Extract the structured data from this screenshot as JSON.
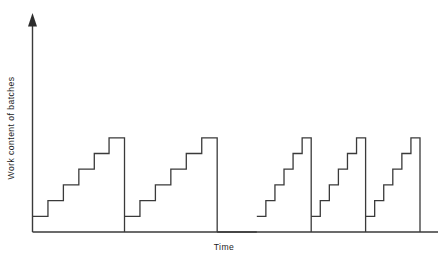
{
  "chart_data": {
    "type": "line",
    "title": "",
    "subtitle": "",
    "xlabel": "Time",
    "ylabel": "Work content of batches",
    "x_tick_labels": [],
    "y_tick_labels": [],
    "grid": false,
    "legend": null,
    "legend_position": "none",
    "xlim": [
      0,
      100
    ],
    "ylim": [
      0,
      7.6
    ],
    "axis_style": {
      "y_axis_arrow": true,
      "x_axis_arrow": false,
      "spines": [
        "left",
        "bottom"
      ],
      "line_color": "#3a3a3a"
    },
    "series": [
      {
        "name": "Work content of batches",
        "color": "#3a3a3a",
        "step_shape": "post",
        "cycles": [
          {
            "cycle_index": 1,
            "group": "wide",
            "x_start": 1.2,
            "x_end": 28.6,
            "peak_value": 6,
            "n_steps": 6,
            "points": [
              [
                1.2,
                1
              ],
              [
                5.8,
                1
              ],
              [
                5.8,
                2
              ],
              [
                10.4,
                2
              ],
              [
                10.4,
                3
              ],
              [
                15.0,
                3
              ],
              [
                15.0,
                4
              ],
              [
                19.6,
                4
              ],
              [
                19.6,
                5
              ],
              [
                24.0,
                5
              ],
              [
                24.0,
                6
              ],
              [
                28.6,
                6
              ],
              [
                28.6,
                0
              ]
            ]
          },
          {
            "cycle_index": 2,
            "group": "wide",
            "x_start": 28.6,
            "x_end": 56.2,
            "peak_value": 6,
            "n_steps": 6,
            "points": [
              [
                28.6,
                1
              ],
              [
                33.2,
                1
              ],
              [
                33.2,
                2
              ],
              [
                37.8,
                2
              ],
              [
                37.8,
                3
              ],
              [
                42.4,
                3
              ],
              [
                42.4,
                4
              ],
              [
                47.0,
                4
              ],
              [
                47.0,
                5
              ],
              [
                51.6,
                5
              ],
              [
                51.6,
                6
              ],
              [
                56.2,
                6
              ],
              [
                56.2,
                0
              ]
            ]
          },
          {
            "cycle_index": 3,
            "group": "narrow",
            "x_start": 68.0,
            "x_end": 84.2,
            "peak_value": 6,
            "n_steps": 6,
            "points": [
              [
                68.0,
                1
              ],
              [
                70.7,
                1
              ],
              [
                70.7,
                2
              ],
              [
                73.4,
                2
              ],
              [
                73.4,
                3
              ],
              [
                76.1,
                3
              ],
              [
                76.1,
                4
              ],
              [
                78.8,
                4
              ],
              [
                78.8,
                5
              ],
              [
                81.5,
                5
              ],
              [
                81.5,
                6
              ],
              [
                84.2,
                6
              ],
              [
                84.2,
                0
              ]
            ]
          },
          {
            "cycle_index": 4,
            "group": "narrow",
            "x_start": 84.2,
            "x_end": 100.4,
            "peak_value": 6,
            "n_steps": 6,
            "points": [
              [
                84.2,
                1
              ],
              [
                86.9,
                1
              ],
              [
                86.9,
                2
              ],
              [
                89.6,
                2
              ],
              [
                89.6,
                3
              ],
              [
                92.3,
                3
              ],
              [
                92.3,
                4
              ],
              [
                95.0,
                4
              ],
              [
                95.0,
                5
              ],
              [
                97.7,
                5
              ],
              [
                97.7,
                6
              ],
              [
                100.4,
                6
              ],
              [
                100.4,
                0
              ]
            ]
          },
          {
            "cycle_index": 5,
            "group": "narrow",
            "x_start": 100.4,
            "x_end": 116.6,
            "peak_value": 6,
            "n_steps": 6,
            "points": [
              [
                100.4,
                1
              ],
              [
                103.1,
                1
              ],
              [
                103.1,
                2
              ],
              [
                105.8,
                2
              ],
              [
                105.8,
                3
              ],
              [
                108.5,
                3
              ],
              [
                108.5,
                4
              ],
              [
                111.2,
                4
              ],
              [
                111.2,
                5
              ],
              [
                113.9,
                5
              ],
              [
                113.9,
                6
              ],
              [
                116.6,
                6
              ],
              [
                116.6,
                0
              ]
            ]
          }
        ],
        "idle_gaps": [
          {
            "from": 56.2,
            "to": 68.0,
            "value": 0
          }
        ]
      }
    ]
  }
}
